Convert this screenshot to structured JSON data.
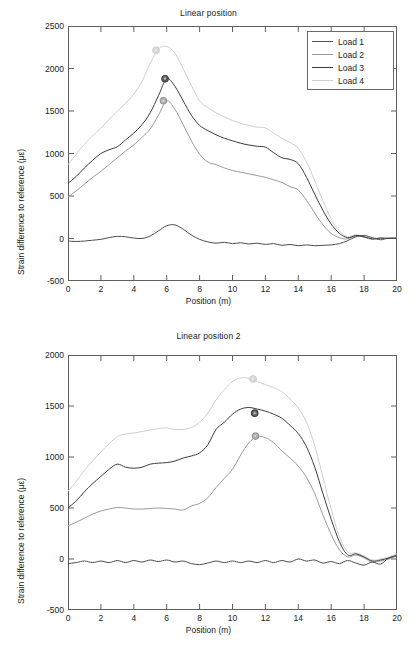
{
  "figure": {
    "xlabel": "Position (m)",
    "ylabel": "Strain difference to reference (με)"
  },
  "legend": {
    "items": [
      {
        "label": "Load 1",
        "color": "#4d4d4d"
      },
      {
        "label": "Load 2",
        "color": "#9a9a9a"
      },
      {
        "label": "Load 3",
        "color": "#3c3c3c"
      },
      {
        "label": "Load 4",
        "color": "#cfcfcf"
      }
    ]
  },
  "chart_data": [
    {
      "type": "line",
      "title": "Linear position",
      "xlabel": "Position (m)",
      "ylabel": "Strain difference to reference (με)",
      "xlim": [
        0,
        20
      ],
      "ylim": [
        -500,
        2500
      ],
      "xticks": [
        0,
        2,
        4,
        6,
        8,
        10,
        12,
        14,
        16,
        18,
        20
      ],
      "yticks": [
        -500,
        0,
        500,
        1000,
        1500,
        2000,
        2500
      ],
      "grid": false,
      "legend_position": "top-right",
      "x": [
        0,
        0.5,
        1,
        1.5,
        2,
        2.5,
        3,
        3.5,
        4,
        4.5,
        5,
        5.5,
        6,
        6.5,
        7,
        7.5,
        8,
        8.5,
        9,
        9.5,
        10,
        10.5,
        11,
        11.5,
        12,
        12.5,
        13,
        13.5,
        14,
        14.5,
        15,
        15.5,
        16,
        16.5,
        17,
        17.5,
        18,
        18.5,
        19,
        19.5,
        20
      ],
      "series": [
        {
          "name": "Load 1",
          "color": "#4d4d4d",
          "values": [
            -30,
            -35,
            -30,
            -20,
            -10,
            10,
            25,
            20,
            5,
            0,
            30,
            90,
            150,
            160,
            110,
            40,
            -10,
            -40,
            -55,
            -45,
            -60,
            -50,
            -65,
            -55,
            -70,
            -60,
            -80,
            -70,
            -85,
            -75,
            -85,
            -80,
            -75,
            -60,
            -25,
            20,
            35,
            10,
            -15,
            5,
            0
          ]
        },
        {
          "name": "Load 2",
          "color": "#9a9a9a",
          "values": [
            490,
            560,
            640,
            720,
            790,
            870,
            950,
            1030,
            1100,
            1190,
            1290,
            1450,
            1620,
            1520,
            1340,
            1150,
            990,
            900,
            870,
            830,
            800,
            780,
            760,
            740,
            720,
            690,
            660,
            610,
            570,
            450,
            300,
            160,
            60,
            10,
            -5,
            30,
            15,
            -10,
            5,
            0,
            5
          ],
          "marker": {
            "x": 5.8,
            "y": 1620
          }
        },
        {
          "name": "Load 3",
          "color": "#3c3c3c",
          "values": [
            650,
            730,
            830,
            920,
            1000,
            1045,
            1080,
            1160,
            1240,
            1340,
            1480,
            1680,
            1880,
            1790,
            1620,
            1450,
            1330,
            1270,
            1220,
            1180,
            1150,
            1120,
            1100,
            1085,
            1075,
            1010,
            950,
            930,
            880,
            720,
            520,
            330,
            170,
            60,
            10,
            35,
            20,
            -5,
            5,
            0,
            5
          ],
          "marker": {
            "x": 5.9,
            "y": 1880
          }
        },
        {
          "name": "Load 4",
          "color": "#cfcfcf",
          "values": [
            870,
            990,
            1110,
            1210,
            1300,
            1400,
            1500,
            1590,
            1700,
            1850,
            2060,
            2230,
            2260,
            2180,
            2000,
            1800,
            1620,
            1540,
            1480,
            1430,
            1390,
            1355,
            1330,
            1310,
            1300,
            1240,
            1180,
            1130,
            1060,
            900,
            680,
            440,
            230,
            90,
            20,
            45,
            25,
            0,
            10,
            5,
            10
          ],
          "marker": {
            "x": 5.35,
            "y": 2215
          }
        }
      ]
    },
    {
      "type": "line",
      "title": "Linear position 2",
      "xlabel": "Position (m)",
      "ylabel": "Strain difference to reference (με)",
      "xlim": [
        0,
        20
      ],
      "ylim": [
        -500,
        2000
      ],
      "xticks": [
        0,
        2,
        4,
        6,
        8,
        10,
        12,
        14,
        16,
        18,
        20
      ],
      "yticks": [
        -500,
        0,
        500,
        1000,
        1500,
        2000
      ],
      "grid": false,
      "legend_position": "none",
      "x": [
        0,
        0.5,
        1,
        1.5,
        2,
        2.5,
        3,
        3.5,
        4,
        4.5,
        5,
        5.5,
        6,
        6.5,
        7,
        7.5,
        8,
        8.5,
        9,
        9.5,
        10,
        10.5,
        11,
        11.5,
        12,
        12.5,
        13,
        13.5,
        14,
        14.5,
        15,
        15.5,
        16,
        16.5,
        17,
        17.5,
        18,
        18.5,
        19,
        19.5,
        20
      ],
      "series": [
        {
          "name": "Load 1",
          "color": "#4d4d4d",
          "values": [
            -45,
            -35,
            -20,
            -35,
            -20,
            -35,
            -15,
            -35,
            -15,
            -30,
            -10,
            -25,
            -10,
            -30,
            -20,
            -45,
            -55,
            -40,
            -20,
            -35,
            -20,
            -35,
            -20,
            -35,
            -15,
            -35,
            -15,
            -30,
            0,
            -20,
            -10,
            -40,
            -25,
            -45,
            -15,
            -40,
            -60,
            -30,
            -50,
            10,
            30
          ]
        },
        {
          "name": "Load 2",
          "color": "#9a9a9a",
          "values": [
            325,
            360,
            400,
            440,
            470,
            490,
            505,
            500,
            490,
            490,
            495,
            500,
            495,
            490,
            480,
            520,
            545,
            600,
            700,
            790,
            880,
            1020,
            1140,
            1200,
            1190,
            1140,
            1060,
            990,
            910,
            800,
            640,
            430,
            240,
            90,
            20,
            40,
            10,
            -30,
            -20,
            0,
            30
          ],
          "marker": {
            "x": 11.4,
            "y": 1205
          }
        },
        {
          "name": "Load 3",
          "color": "#3c3c3c",
          "values": [
            500,
            570,
            660,
            740,
            810,
            880,
            930,
            900,
            890,
            900,
            930,
            940,
            945,
            960,
            990,
            1010,
            1040,
            1120,
            1270,
            1340,
            1420,
            1470,
            1485,
            1470,
            1450,
            1420,
            1380,
            1310,
            1230,
            1100,
            900,
            640,
            390,
            170,
            40,
            50,
            20,
            -20,
            -10,
            10,
            40
          ],
          "marker": {
            "x": 11.35,
            "y": 1430
          }
        },
        {
          "name": "Load 4",
          "color": "#cfcfcf",
          "values": [
            665,
            760,
            870,
            960,
            1050,
            1130,
            1200,
            1225,
            1235,
            1250,
            1265,
            1280,
            1285,
            1270,
            1270,
            1290,
            1340,
            1430,
            1560,
            1660,
            1740,
            1775,
            1770,
            1740,
            1710,
            1680,
            1640,
            1570,
            1480,
            1340,
            1110,
            800,
            490,
            220,
            70,
            60,
            30,
            -10,
            0,
            20,
            50
          ],
          "marker": {
            "x": 11.25,
            "y": 1765
          }
        }
      ]
    }
  ]
}
